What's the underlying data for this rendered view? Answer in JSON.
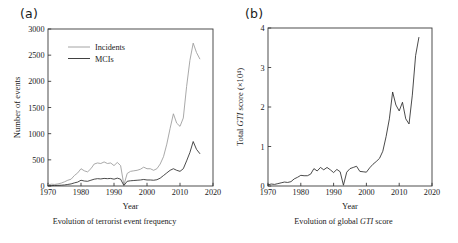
{
  "figure": {
    "panels": [
      {
        "key": "a",
        "label": "(a)",
        "caption_prefix": "Evolution of terrorist event frequency",
        "caption_italic": "",
        "caption_suffix": ""
      },
      {
        "key": "b",
        "label": "(b)",
        "caption_prefix": "Evolution of global ",
        "caption_italic": "GTI",
        "caption_suffix": " score"
      }
    ]
  },
  "chart_data": [
    {
      "type": "line",
      "panel": "a",
      "title": "Evolution of terrorist event frequency",
      "xlabel": "Year",
      "ylabel": "Number of events",
      "xlim": [
        1970,
        2020
      ],
      "ylim": [
        0,
        3000
      ],
      "xticks": [
        1970,
        1980,
        1990,
        2000,
        2010,
        2020
      ],
      "yticks": [
        0,
        500,
        1000,
        1500,
        2000,
        2500,
        3000
      ],
      "xtick_labels": [
        "1970",
        "1980",
        "1990",
        "2000",
        "2010",
        "2020"
      ],
      "ytick_labels": [
        "0",
        "500",
        "1000",
        "1500",
        "2000",
        "2500",
        "3000"
      ],
      "grid": false,
      "legend_position": "upper-left",
      "x": [
        1970,
        1971,
        1972,
        1973,
        1974,
        1975,
        1976,
        1977,
        1978,
        1979,
        1980,
        1981,
        1982,
        1983,
        1984,
        1985,
        1986,
        1987,
        1988,
        1989,
        1990,
        1991,
        1992,
        1993,
        1994,
        1995,
        1996,
        1997,
        1998,
        1999,
        2000,
        2001,
        2002,
        2003,
        2004,
        2005,
        2006,
        2007,
        2008,
        2009,
        2010,
        2011,
        2012,
        2013,
        2014,
        2015,
        2016
      ],
      "series": [
        {
          "name": "Incidents",
          "color": "#9a9a9a",
          "values": [
            20,
            35,
            30,
            40,
            55,
            80,
            110,
            130,
            200,
            250,
            330,
            290,
            270,
            330,
            420,
            440,
            430,
            460,
            430,
            440,
            390,
            450,
            390,
            20,
            240,
            280,
            290,
            300,
            320,
            360,
            330,
            330,
            300,
            330,
            420,
            560,
            800,
            1100,
            1380,
            1200,
            1140,
            1300,
            1900,
            2400,
            2730,
            2550,
            2430
          ]
        },
        {
          "name": "MCIs",
          "color": "#2b2b2b",
          "values": [
            5,
            8,
            10,
            12,
            15,
            20,
            30,
            40,
            60,
            75,
            110,
            95,
            90,
            110,
            130,
            140,
            135,
            145,
            140,
            145,
            130,
            150,
            130,
            10,
            90,
            100,
            105,
            110,
            115,
            125,
            115,
            115,
            110,
            120,
            150,
            200,
            250,
            300,
            330,
            300,
            280,
            330,
            480,
            640,
            850,
            700,
            620
          ]
        }
      ]
    },
    {
      "type": "line",
      "panel": "b",
      "title": "Evolution of global GTI score",
      "xlabel": "Year",
      "ylabel": "Total GTI score (×10⁴)",
      "ylabel_parts": [
        "Total ",
        "GTI",
        " score (×10⁴)"
      ],
      "xlim": [
        1970,
        2020
      ],
      "ylim": [
        0,
        4
      ],
      "xticks": [
        1970,
        1980,
        1990,
        2000,
        2010,
        2020
      ],
      "yticks": [
        0,
        1,
        2,
        3,
        4
      ],
      "xtick_labels": [
        "1970",
        "1980",
        "1990",
        "2000",
        "2010",
        "2020"
      ],
      "ytick_labels": [
        "0",
        "1",
        "2",
        "3",
        "4"
      ],
      "grid": false,
      "legend_position": "none",
      "x": [
        1970,
        1971,
        1972,
        1973,
        1974,
        1975,
        1976,
        1977,
        1978,
        1979,
        1980,
        1981,
        1982,
        1983,
        1984,
        1985,
        1986,
        1987,
        1988,
        1989,
        1990,
        1991,
        1992,
        1993,
        1994,
        1995,
        1996,
        1997,
        1998,
        1999,
        2000,
        2001,
        2002,
        2003,
        2004,
        2005,
        2006,
        2007,
        2008,
        2009,
        2010,
        2011,
        2012,
        2013,
        2014,
        2015,
        2016
      ],
      "series": [
        {
          "name": "Total GTI score",
          "color": "#2b2b2b",
          "values": [
            0.03,
            0.05,
            0.04,
            0.06,
            0.08,
            0.1,
            0.09,
            0.11,
            0.18,
            0.22,
            0.27,
            0.26,
            0.26,
            0.3,
            0.44,
            0.38,
            0.47,
            0.41,
            0.47,
            0.41,
            0.34,
            0.42,
            0.36,
            0.02,
            0.35,
            0.44,
            0.47,
            0.5,
            0.37,
            0.36,
            0.35,
            0.46,
            0.55,
            0.62,
            0.7,
            0.88,
            1.25,
            1.7,
            2.38,
            2.05,
            1.9,
            2.12,
            1.7,
            1.57,
            2.3,
            3.3,
            3.76
          ]
        }
      ]
    }
  ]
}
